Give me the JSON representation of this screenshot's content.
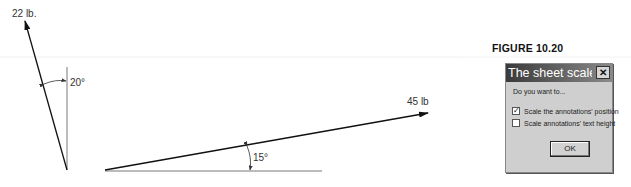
{
  "diagram": {
    "force_a": {
      "label": "22 lb.",
      "angle_label": "20°"
    },
    "force_b": {
      "label": "45 lb",
      "angle_label": "15°"
    }
  },
  "figure": {
    "caption": "FIGURE 10.20"
  },
  "dialog": {
    "title": "The sheet scale ha...",
    "close_label": "✕",
    "prompt": "Do you want to...",
    "options": [
      {
        "label": "Scale the annotations' position",
        "checked": true,
        "mark": "✓"
      },
      {
        "label": "Scale annotations' text height",
        "checked": false,
        "mark": ""
      }
    ],
    "ok_label": "OK"
  }
}
